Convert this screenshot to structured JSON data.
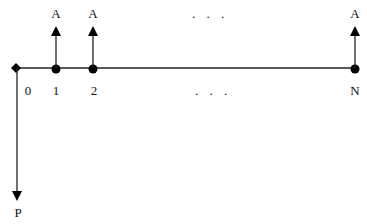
{
  "diagram": {
    "type": "cash-flow-timeline",
    "origin_label": "0",
    "present_value_label": "P",
    "periods": [
      {
        "label": "1",
        "payment_label": "A"
      },
      {
        "label": "2",
        "payment_label": "A"
      },
      {
        "label": "N",
        "payment_label": "A"
      }
    ],
    "ellipsis_top": ". . .",
    "ellipsis_bottom": ". . .",
    "colors": {
      "line": "#111111",
      "background": "#ffffff"
    }
  }
}
